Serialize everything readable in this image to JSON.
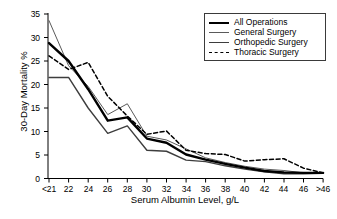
{
  "chart_data": {
    "type": "line",
    "title": "",
    "xlabel": "Serum Albumin Level, g/L",
    "ylabel": "30-Day Mortality %",
    "categories": [
      "<21",
      "22",
      "24",
      "26",
      "28",
      "30",
      "32",
      "34",
      "36",
      "38",
      "40",
      "42",
      "44",
      "46",
      ">46"
    ],
    "xtick_labels": [
      "<21",
      "22",
      "24",
      "26",
      "28",
      "30",
      "32",
      "34",
      "36",
      "38",
      "40",
      "42",
      "44",
      "46",
      ">46"
    ],
    "ytick_labels": [
      "0",
      "5",
      "10",
      "15",
      "20",
      "25",
      "30",
      "35"
    ],
    "ylim": [
      0,
      35
    ],
    "ytick_step": 5,
    "grid": false,
    "legend_position": "top-right",
    "series": [
      {
        "name": "All Operations",
        "style": "solid-thick",
        "color": "#000000",
        "values": [
          28.8,
          25.0,
          19.0,
          12.3,
          13.0,
          8.5,
          7.6,
          5.1,
          4.0,
          3.1,
          2.3,
          1.6,
          1.3,
          1.2,
          1.2
        ]
      },
      {
        "name": "General Surgery",
        "style": "solid-thin",
        "color": "#5a5a5a",
        "values": [
          33.6,
          24.0,
          19.6,
          13.6,
          15.9,
          9.0,
          8.2,
          6.3,
          4.4,
          3.4,
          2.6,
          2.0,
          1.7,
          1.2,
          1.2
        ]
      },
      {
        "name": "Orthopedic Surgery",
        "style": "solid-medium",
        "color": "#3d3d3d",
        "values": [
          21.5,
          21.5,
          15.0,
          9.6,
          11.2,
          6.0,
          5.8,
          3.9,
          3.6,
          2.7,
          2.0,
          1.4,
          1.0,
          1.0,
          1.1
        ]
      },
      {
        "name": "Thoracic Surgery",
        "style": "dashed",
        "color": "#000000",
        "values": [
          26.1,
          23.2,
          24.7,
          17.5,
          13.3,
          9.4,
          10.1,
          6.0,
          5.3,
          5.1,
          3.7,
          4.0,
          4.2,
          2.2,
          1.2
        ]
      }
    ],
    "legend": [
      {
        "label": "All Operations",
        "style": "solid-thick"
      },
      {
        "label": "General Surgery",
        "style": "solid-thin"
      },
      {
        "label": "Orthopedic Surgery",
        "style": "solid-medium"
      },
      {
        "label": "Thoracic Surgery",
        "style": "dashed"
      }
    ]
  }
}
